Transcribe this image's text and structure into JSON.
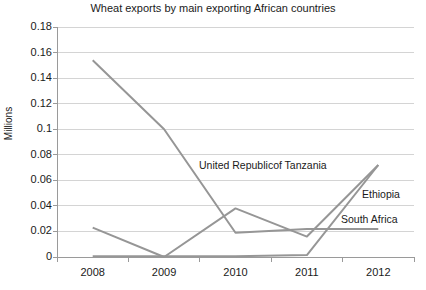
{
  "chart_data": {
    "type": "line",
    "title": "Wheat exports by main exporting African countries",
    "xlabel": "",
    "ylabel": "Millions",
    "categories": [
      "2008",
      "2009",
      "2010",
      "2011",
      "2012"
    ],
    "ylim": [
      0,
      0.18
    ],
    "yticks": [
      0,
      0.02,
      0.04,
      0.06,
      0.08,
      0.1,
      0.12,
      0.14,
      0.16,
      0.18
    ],
    "ytick_labels": [
      "0",
      "0.02",
      "0.04",
      "0.06",
      "0.08",
      "0.1",
      "0.12",
      "0.14",
      "0.16",
      "0.18"
    ],
    "grid": true,
    "legend_position": "inline-annotations",
    "series": [
      {
        "name": "United Republicof Tanzania",
        "color": "#969696",
        "values": [
          0.154,
          0.1,
          0.019,
          0.022,
          0.022
        ]
      },
      {
        "name": "Ethiopia",
        "color": "#969696",
        "values": [
          0.023,
          0.0,
          0.038,
          0.016,
          0.072
        ]
      },
      {
        "name": "South Africa",
        "color": "#969696",
        "values": [
          0.0005,
          0.0005,
          0.0005,
          0.0015,
          0.072
        ]
      }
    ],
    "annotations": [
      {
        "text": "United Republicof Tanzania",
        "x_px": 199,
        "y_px": 159
      },
      {
        "text": "Ethiopia",
        "x_px": 362,
        "y_px": 188
      },
      {
        "text": "South Africa",
        "x_px": 341,
        "y_px": 213
      }
    ]
  }
}
